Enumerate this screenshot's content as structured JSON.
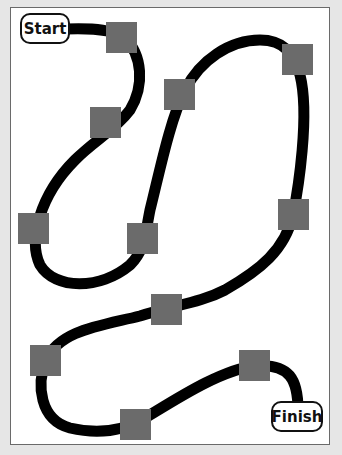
{
  "board": {
    "background": "#ffffff",
    "frame_color": "#6a6a6a",
    "path_color": "#000000",
    "space_color": "#6b6b6b",
    "start_label": "Start",
    "finish_label": "Finish",
    "spaces": [
      {
        "id": 1,
        "x": 106,
        "y": 22
      },
      {
        "id": 2,
        "x": 90,
        "y": 107
      },
      {
        "id": 3,
        "x": 164,
        "y": 79
      },
      {
        "id": 4,
        "x": 282,
        "y": 44
      },
      {
        "id": 5,
        "x": 18,
        "y": 213
      },
      {
        "id": 6,
        "x": 127,
        "y": 223
      },
      {
        "id": 7,
        "x": 278,
        "y": 199
      },
      {
        "id": 8,
        "x": 151,
        "y": 294
      },
      {
        "id": 9,
        "x": 30,
        "y": 345
      },
      {
        "id": 10,
        "x": 239,
        "y": 350
      },
      {
        "id": 11,
        "x": 120,
        "y": 409
      }
    ]
  }
}
